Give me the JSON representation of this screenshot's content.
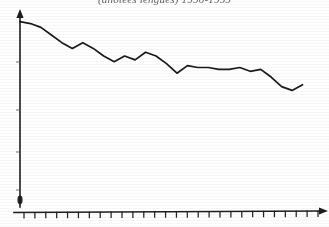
{
  "chart_data": {
    "type": "line",
    "title": "(anotees lengues) 1990-1999",
    "xlabel": "",
    "ylabel": "",
    "grid": false,
    "legend": null,
    "xlim": [
      0,
      28
    ],
    "ylim": [
      0,
      100
    ],
    "x_tick_count": 28,
    "y_tick_count": 4,
    "x_tick_labels": [],
    "y_tick_labels": [],
    "series": [
      {
        "name": "series-1",
        "x": [
          0,
          1,
          2,
          3,
          4,
          5,
          6,
          7,
          8,
          9,
          10,
          11,
          12,
          13,
          14,
          15,
          16,
          17,
          18,
          19,
          20,
          21,
          22,
          23,
          24,
          25,
          26,
          27
        ],
        "values": [
          96,
          95,
          93,
          89,
          85,
          82,
          85,
          82,
          78,
          75,
          78,
          76,
          80,
          78,
          74,
          69,
          73,
          72,
          72,
          71,
          71,
          72,
          70,
          71,
          67,
          62,
          60,
          63
        ]
      }
    ]
  },
  "axes": {
    "y_axis_name": "vertical-value-axis",
    "x_axis_name": "horizontal-category-axis",
    "y_arrow": true,
    "x_arrow": true
  },
  "colors": {
    "line": "#1a1a1a",
    "axis": "#1d1d1d",
    "background": "#ffffff",
    "title": "#3a3a3a"
  }
}
